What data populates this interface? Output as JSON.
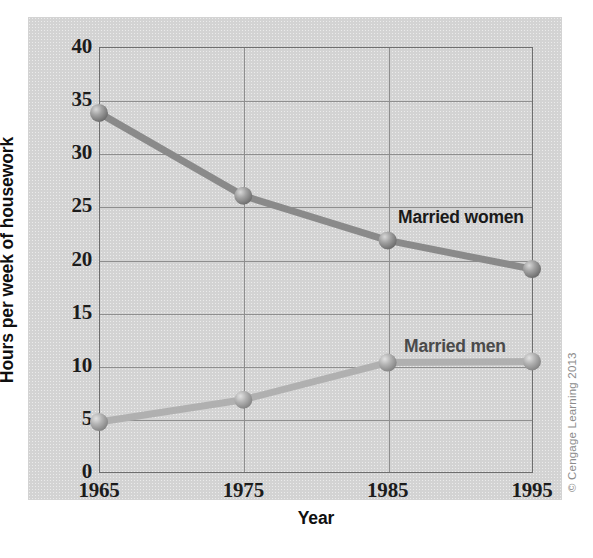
{
  "chart_data": {
    "type": "line",
    "title": "",
    "xlabel": "Year",
    "ylabel": "Hours per week of housework",
    "categories": [
      "1965",
      "1975",
      "1985",
      "1995"
    ],
    "x": [
      1965,
      1975,
      1985,
      1995
    ],
    "xlim": [
      1965,
      1995
    ],
    "ylim": [
      0,
      40
    ],
    "yticks": [
      "0",
      "5",
      "10",
      "15",
      "20",
      "25",
      "30",
      "35",
      "40"
    ],
    "ytick_values": [
      0,
      5,
      10,
      15,
      20,
      25,
      30,
      35,
      40
    ],
    "grid": "both",
    "legend_position": "inline-annotations",
    "series": [
      {
        "name": "Married women",
        "values": [
          33.8,
          26.0,
          21.8,
          19.1
        ],
        "color": "#8a8a8a",
        "label_color": "#1a1a1a"
      },
      {
        "name": "Married men",
        "values": [
          4.7,
          6.8,
          10.3,
          10.4
        ],
        "color": "#b0b0b0",
        "label_color": "#4a4a4a"
      }
    ],
    "annotations": [
      {
        "text": "Married women",
        "series": "Married women"
      },
      {
        "text": "Married men",
        "series": "Married men"
      }
    ]
  },
  "credit": {
    "text": "© Cengage Learning 2013"
  },
  "colors": {
    "panel_background": "#d3d3d3",
    "page_background": "#ffffff",
    "axis": "#6e6e6e",
    "gridline": "#8e8e8e",
    "text": "#1c1c1c",
    "women_line": "#8a8a8a",
    "men_line": "#b0b0b0",
    "credit_text": "#8c8c8c"
  }
}
